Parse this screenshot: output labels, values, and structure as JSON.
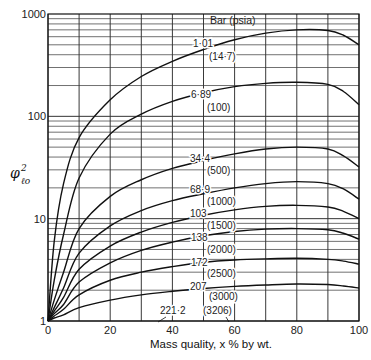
{
  "chart_data": {
    "type": "line",
    "title": "",
    "xlabel": "Mass quality, x % by wt.",
    "ylabel": "φ²ℓo",
    "xlim": [
      0,
      100
    ],
    "ylim": [
      1,
      1000
    ],
    "yscale": "log",
    "grid": true,
    "x_ticks": [
      "0",
      "20",
      "40",
      "60",
      "80",
      "100"
    ],
    "y_ticks": [
      "1",
      "10",
      "100",
      "1000"
    ],
    "legend_title": "Bar (psia)",
    "x": [
      0,
      2,
      5,
      10,
      20,
      30,
      40,
      50,
      60,
      70,
      80,
      90,
      95,
      100
    ],
    "series": [
      {
        "name": "1·01 (14·7)",
        "bar": "1·01",
        "psia": "(14·7)",
        "values": [
          1,
          6,
          22,
          62,
          145,
          245,
          345,
          450,
          560,
          650,
          700,
          690,
          620,
          500
        ]
      },
      {
        "name": "6·89 (100)",
        "bar": "6·89",
        "psia": "(100)",
        "values": [
          1,
          2.5,
          7,
          25,
          67,
          105,
          140,
          170,
          195,
          210,
          215,
          205,
          175,
          130
        ]
      },
      {
        "name": "34·4 (500)",
        "bar": "34·4",
        "psia": "(500)",
        "values": [
          1,
          1.6,
          3,
          8,
          16.5,
          24,
          31,
          37,
          43,
          48,
          50,
          48,
          41,
          32
        ]
      },
      {
        "name": "68·9 (1000)",
        "bar": "68·9",
        "psia": "(1000)",
        "values": [
          1,
          1.35,
          2.1,
          4.6,
          8.5,
          12,
          15,
          17.5,
          20,
          22,
          23,
          22,
          19.5,
          15.5
        ]
      },
      {
        "name": "103 (1500)",
        "bar": "103",
        "psia": "(1500)",
        "values": [
          1,
          1.25,
          1.7,
          3.2,
          5.4,
          7.4,
          9.2,
          10.8,
          12.2,
          13.2,
          13.5,
          13,
          11.8,
          10
        ]
      },
      {
        "name": "138 (2000)",
        "bar": "138",
        "psia": "(2000)",
        "values": [
          1,
          1.18,
          1.45,
          2.4,
          3.7,
          4.9,
          5.9,
          6.8,
          7.5,
          7.9,
          8,
          7.8,
          7.2,
          6.3
        ]
      },
      {
        "name": "172 (2500)",
        "bar": "172",
        "psia": "(2500)",
        "values": [
          1,
          1.12,
          1.3,
          1.8,
          2.5,
          3.0,
          3.4,
          3.75,
          3.95,
          4.05,
          4.1,
          4.0,
          3.85,
          3.6
        ]
      },
      {
        "name": "207 (3000)",
        "bar": "207",
        "psia": "(3000)",
        "values": [
          1,
          1.07,
          1.15,
          1.35,
          1.6,
          1.8,
          1.95,
          2.08,
          2.18,
          2.25,
          2.3,
          2.27,
          2.2,
          2.1
        ]
      },
      {
        "name": "221·2 (3206)",
        "bar": "221·2",
        "psia": "(3206)",
        "values": [
          1,
          1,
          1,
          1,
          1,
          1,
          1,
          1,
          1,
          1,
          1,
          1,
          1,
          1
        ]
      }
    ],
    "legend_position": "inline labels near x≈50–60%"
  }
}
